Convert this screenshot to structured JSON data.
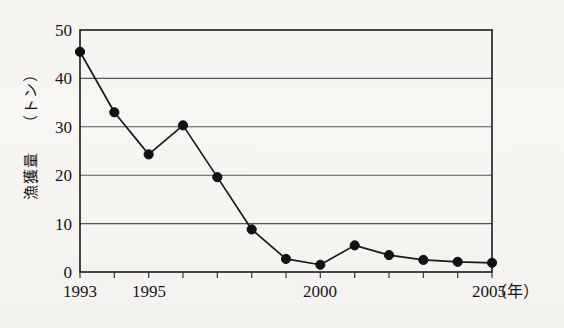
{
  "chart_data": {
    "type": "line",
    "title": "",
    "xlabel": "年",
    "ylabel": "漁獲量（トン）",
    "ylabel_main": "漁獲量",
    "ylabel_unit": "（トン）",
    "x_unit_label": "（年）",
    "xlim": [
      1993,
      2005
    ],
    "ylim": [
      0,
      50
    ],
    "grid": true,
    "grid_axis": "y",
    "legend": "none",
    "series_color": "#121215",
    "marker": "filled-circle",
    "x": [
      1993,
      1994,
      1995,
      1996,
      1997,
      1998,
      1999,
      2000,
      2001,
      2002,
      2003,
      2004,
      2005
    ],
    "categories": [
      "1993",
      "1994",
      "1995",
      "1996",
      "1997",
      "1998",
      "1999",
      "2000",
      "2001",
      "2002",
      "2003",
      "2004",
      "2005"
    ],
    "values": [
      45.5,
      33.0,
      24.3,
      30.3,
      19.6,
      8.8,
      2.7,
      1.5,
      5.5,
      3.5,
      2.5,
      2.1,
      1.9
    ],
    "y_ticks": [
      0,
      10,
      20,
      30,
      40,
      50
    ],
    "y_tick_labels": [
      "0",
      "10",
      "20",
      "30",
      "40",
      "50"
    ],
    "x_ticks": [
      1993,
      1994,
      1995,
      1996,
      1997,
      1998,
      1999,
      2000,
      2001,
      2002,
      2003,
      2004,
      2005
    ],
    "x_tick_labels_shown": [
      "1993",
      "1995",
      "2000",
      "2005"
    ],
    "x_labeled_years": [
      1993,
      1995,
      2000,
      2005
    ]
  }
}
